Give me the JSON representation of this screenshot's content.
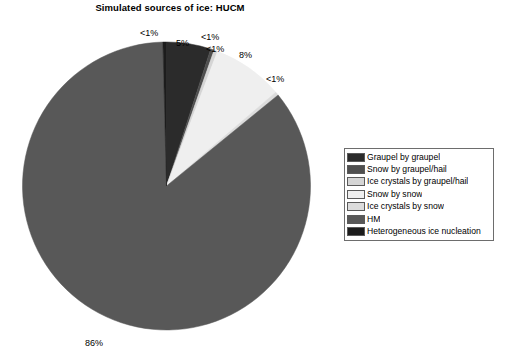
{
  "chart_data": {
    "type": "pie",
    "title": "Simulated sources of ice: HUCM",
    "xlabel": "",
    "ylabel": "",
    "legend_position": "right",
    "grid": false,
    "categories": [
      "Graupel by graupel",
      "Snow by graupel/hail",
      "Ice crystals by graupel/hail",
      "Snow by snow",
      "Ice crystals by snow",
      "HM",
      "Heterogeneous ice nucleation"
    ],
    "values": [
      5,
      0.4,
      0.4,
      8,
      0.4,
      86,
      0.4
    ],
    "value_labels": [
      "5%",
      "<1%",
      "<1%",
      "8%",
      "<1%",
      "86%",
      "<1%"
    ],
    "colors": [
      "#2b2b2b",
      "#4f4f4f",
      "#d5d5d5",
      "#efefef",
      "#dcdcdc",
      "#585858",
      "#1c1c1c"
    ]
  },
  "title": {
    "text": "Simulated sources of ice: HUCM"
  },
  "pie": {
    "labels": [
      {
        "text": "<1%",
        "x": 140,
        "y": 29
      },
      {
        "text": "5%",
        "x": 176,
        "y": 39
      },
      {
        "text": "<1%",
        "x": 201,
        "y": 33
      },
      {
        "text": "<1%",
        "x": 206,
        "y": 45
      },
      {
        "text": "8%",
        "x": 239,
        "y": 51
      },
      {
        "text": "<1%",
        "x": 266,
        "y": 75
      },
      {
        "text": "86%",
        "x": 85,
        "y": 339
      }
    ]
  },
  "legend": {
    "items": [
      {
        "label": "Graupel by graupel",
        "color": "#2b2b2b"
      },
      {
        "label": "Snow by graupel/hail",
        "color": "#4f4f4f"
      },
      {
        "label": "Ice crystals by graupel/hail",
        "color": "#d5d5d5"
      },
      {
        "label": "Snow by snow",
        "color": "#efefef"
      },
      {
        "label": "Ice crystals by snow",
        "color": "#dcdcdc"
      },
      {
        "label": "HM",
        "color": "#585858"
      },
      {
        "label": "Heterogeneous ice nucleation",
        "color": "#1c1c1c"
      }
    ]
  }
}
